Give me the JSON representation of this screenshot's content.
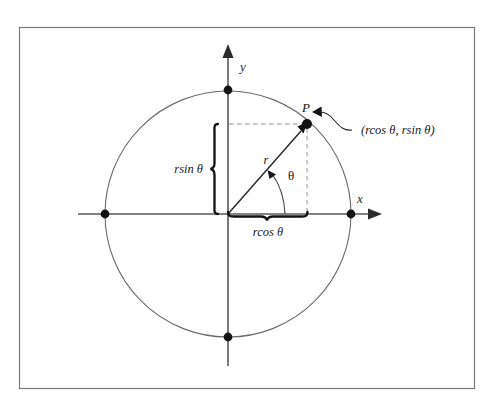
{
  "figure": {
    "kind": "unit-circle-polar-coordinates-diagram",
    "border_color": "#7a7a7a",
    "background_color": "#ffffff",
    "ink_color": "#1a1a1a",
    "axis_color": "#555555",
    "circle_color": "#6b6b6b",
    "dash_color": "#8a8a8a"
  },
  "axes": {
    "x_label": "x",
    "y_label": "y"
  },
  "point": {
    "label": "P",
    "coordinates_label": "(rcos θ, rsin θ)"
  },
  "segments": {
    "radius_label": "r",
    "angle_label": "θ",
    "horizontal_brace_label": "rcos θ",
    "vertical_brace_label": "rsin θ"
  },
  "geometry": {
    "center_x": 228,
    "center_y": 214,
    "radius": 123,
    "point_x": 307,
    "point_y": 124,
    "intersections": [
      {
        "name": "right",
        "x": 351,
        "y": 214
      },
      {
        "name": "left",
        "x": 105,
        "y": 214
      },
      {
        "name": "top",
        "x": 228,
        "y": 90
      },
      {
        "name": "bottom",
        "x": 228,
        "y": 337
      }
    ]
  }
}
